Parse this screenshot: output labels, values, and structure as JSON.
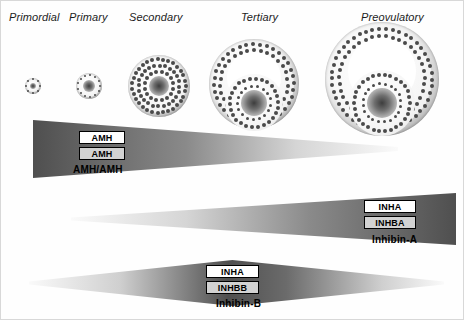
{
  "figure": {
    "background_color": "#fefefe",
    "border_color": "#d8d8d8"
  },
  "stages": [
    {
      "label": "Primordial",
      "x": 8,
      "y": 10
    },
    {
      "label": "Primary",
      "x": 68,
      "y": 10
    },
    {
      "label": "Secondary",
      "x": 128,
      "y": 10
    },
    {
      "label": "Tertiary",
      "x": 240,
      "y": 10
    },
    {
      "label": "Preovulatory",
      "x": 360,
      "y": 10
    }
  ],
  "follicles": [
    {
      "name": "primordial-follicle",
      "cx": 32,
      "cy": 85,
      "r": 8,
      "type": "solid",
      "rings": 1,
      "oocyte_r": 3
    },
    {
      "name": "primary-follicle",
      "cx": 88,
      "cy": 85,
      "r": 13,
      "type": "solid",
      "rings": 1,
      "oocyte_r": 6
    },
    {
      "name": "secondary-follicle",
      "cx": 158,
      "cy": 85,
      "r": 31,
      "type": "solid",
      "rings": 3,
      "oocyte_r": 10
    },
    {
      "name": "tertiary-follicle",
      "cx": 253,
      "cy": 83,
      "r": 45,
      "type": "antral",
      "oocyte_r": 13
    },
    {
      "name": "preovulatory-follicle",
      "cx": 381,
      "cy": 78,
      "r": 57,
      "type": "antral",
      "oocyte_r": 15
    }
  ],
  "bars": [
    {
      "name": "amh-bar",
      "caption": "AMH/AMH",
      "caption_x": 72,
      "caption_y": 163,
      "direction": "decreasing",
      "x": 32,
      "y": 118,
      "width": 365,
      "height": 60,
      "left_thickness": 58,
      "right_thickness": 4,
      "dark_end": "left",
      "tags": [
        {
          "name": "amh-protein-tag",
          "label": "AMH",
          "style": "protein",
          "x": 78,
          "y": 130,
          "width": 46,
          "height": 13
        },
        {
          "name": "amh-gene-tag",
          "label": "AMH",
          "style": "gene",
          "x": 78,
          "y": 146,
          "width": 46,
          "height": 13
        }
      ]
    },
    {
      "name": "inhibin-a-bar",
      "caption": "Inhibin-A",
      "caption_x": 371,
      "caption_y": 233,
      "direction": "increasing",
      "x": 70,
      "y": 190,
      "width": 385,
      "height": 56,
      "left_thickness": 3,
      "right_thickness": 52,
      "dark_end": "right",
      "tags": [
        {
          "name": "inha-protein-tag",
          "label": "INHA",
          "style": "protein",
          "x": 363,
          "y": 199,
          "width": 52,
          "height": 13
        },
        {
          "name": "inhba-gene-tag",
          "label": "INHBA",
          "style": "gene",
          "x": 363,
          "y": 215,
          "width": 52,
          "height": 13
        }
      ]
    },
    {
      "name": "inhibin-b-bar",
      "caption": "Inhibin-B",
      "caption_x": 215,
      "caption_y": 297,
      "direction": "peak-middle",
      "x": 28,
      "y": 256,
      "width": 415,
      "height": 52,
      "left_thickness": 3,
      "mid_thickness": 46,
      "right_thickness": 3,
      "dark_end": "middle",
      "tags": [
        {
          "name": "inha-protein-tag-b",
          "label": "INHA",
          "style": "protein",
          "x": 205,
          "y": 264,
          "width": 53,
          "height": 13
        },
        {
          "name": "inhbb-gene-tag",
          "label": "INHBB",
          "style": "gene",
          "x": 205,
          "y": 280,
          "width": 53,
          "height": 13
        }
      ]
    }
  ],
  "colors": {
    "bar_dark": "#4f4f4f",
    "bar_light": "#fafafa",
    "gene_box_fill": "#d2d2d2",
    "protein_box_fill": "#ffffff",
    "text": "#000000",
    "oocyte": "#3d3d3d",
    "granulosa_cell": "#4a4a4a"
  }
}
